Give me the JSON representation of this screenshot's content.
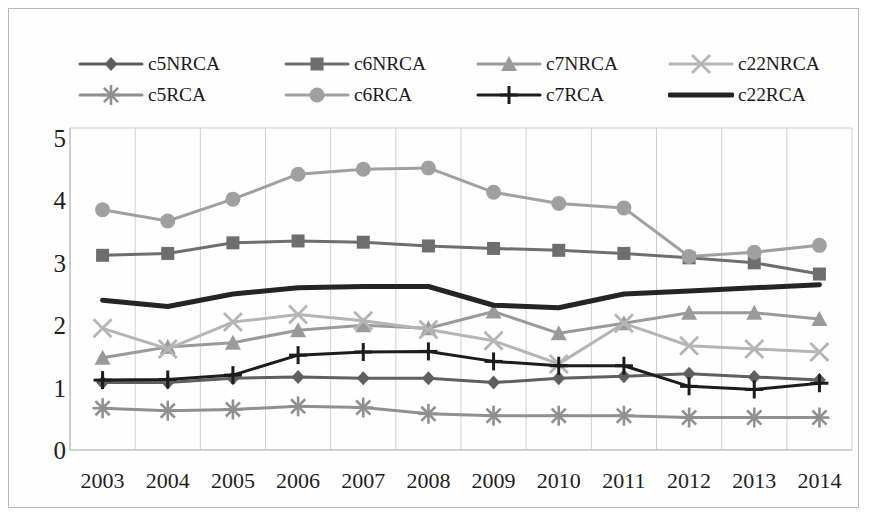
{
  "chart_data": {
    "type": "line",
    "title": "",
    "subtitle": "",
    "xlabel": "",
    "ylabel": "",
    "x": [
      2003,
      2004,
      2005,
      2006,
      2007,
      2008,
      2009,
      2010,
      2011,
      2012,
      2013,
      2014
    ],
    "categories": [
      "2003",
      "2004",
      "2005",
      "2006",
      "2007",
      "2008",
      "2009",
      "2010",
      "2011",
      "2012",
      "2013",
      "2014"
    ],
    "ylim": [
      0,
      5
    ],
    "yticks": [
      0,
      1,
      2,
      3,
      4,
      5
    ],
    "ytick_labels": [
      "0",
      "1",
      "2",
      "3",
      "4",
      "5"
    ],
    "grid": "vertical",
    "legend_position": "top",
    "series": [
      {
        "name": "c5NRCA",
        "marker": "diamond",
        "color": "#5f5f5f",
        "line_width": 3,
        "values": [
          1.08,
          1.08,
          1.15,
          1.17,
          1.15,
          1.15,
          1.08,
          1.15,
          1.18,
          1.22,
          1.17,
          1.12
        ]
      },
      {
        "name": "c6NRCA",
        "marker": "square",
        "color": "#6e6e6e",
        "line_width": 3,
        "values": [
          3.12,
          3.15,
          3.32,
          3.35,
          3.33,
          3.27,
          3.23,
          3.2,
          3.15,
          3.08,
          3.0,
          2.82
        ]
      },
      {
        "name": "c7NRCA",
        "marker": "triangle",
        "color": "#9a9a9a",
        "line_width": 3,
        "values": [
          1.48,
          1.65,
          1.72,
          1.92,
          2.0,
          1.95,
          2.22,
          1.87,
          2.03,
          2.2,
          2.2,
          2.1
        ]
      },
      {
        "name": "c22NRCA",
        "marker": "x",
        "color": "#b5b5b5",
        "line_width": 3,
        "values": [
          1.95,
          1.62,
          2.05,
          2.17,
          2.07,
          1.93,
          1.75,
          1.38,
          2.03,
          1.67,
          1.62,
          1.57
        ]
      },
      {
        "name": "c5RCA",
        "marker": "asterisk",
        "color": "#909090",
        "line_width": 3,
        "values": [
          0.67,
          0.63,
          0.65,
          0.7,
          0.68,
          0.58,
          0.55,
          0.55,
          0.55,
          0.52,
          0.52,
          0.52
        ]
      },
      {
        "name": "c6RCA",
        "marker": "circle",
        "color": "#a0a0a0",
        "line_width": 3,
        "values": [
          3.85,
          3.67,
          4.02,
          4.42,
          4.5,
          4.52,
          4.13,
          3.95,
          3.88,
          3.1,
          3.17,
          3.28
        ]
      },
      {
        "name": "c7RCA",
        "marker": "plus",
        "color": "#1c1c1c",
        "line_width": 3,
        "values": [
          1.12,
          1.13,
          1.2,
          1.52,
          1.57,
          1.58,
          1.42,
          1.35,
          1.35,
          1.02,
          0.97,
          1.07
        ]
      },
      {
        "name": "c22RCA",
        "marker": "none",
        "color": "#242424",
        "line_width": 5,
        "values": [
          2.4,
          2.3,
          2.5,
          2.6,
          2.62,
          2.62,
          2.32,
          2.28,
          2.5,
          2.55,
          2.6,
          2.65
        ]
      }
    ]
  },
  "legend": {
    "rows": [
      [
        {
          "label": "c5NRCA"
        },
        {
          "label": "c6NRCA"
        },
        {
          "label": "c7NRCA"
        },
        {
          "label": "c22NRCA"
        }
      ],
      [
        {
          "label": "c5RCA"
        },
        {
          "label": "c6RCA"
        },
        {
          "label": "c7RCA"
        },
        {
          "label": "c22RCA"
        }
      ]
    ]
  },
  "colors": {
    "frame_border": "#b9b9b9",
    "gridline": "#cfcfcf",
    "axis_line": "#c2c2c2",
    "background": "#ffffff",
    "text": "#1d1d1d"
  }
}
